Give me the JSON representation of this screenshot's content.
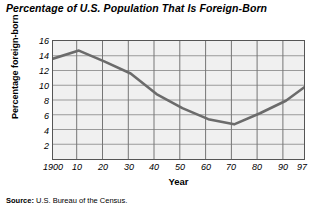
{
  "chart_data": {
    "type": "line",
    "title": "Percentage of U.S. Population That Is Foreign-Born",
    "xlabel": "Year",
    "ylabel": "Percentage foreign-born",
    "x": [
      1900,
      1910,
      1920,
      1930,
      1940,
      1950,
      1960,
      1970,
      1980,
      1990,
      1997
    ],
    "values": [
      13.6,
      14.7,
      13.2,
      11.6,
      8.8,
      6.9,
      5.4,
      4.7,
      6.2,
      7.9,
      9.7
    ],
    "x_tick_labels": [
      "1900",
      "10",
      "20",
      "30",
      "40",
      "50",
      "60",
      "70",
      "80",
      "90",
      "97"
    ],
    "y_tick_labels": [
      "2",
      "4",
      "6",
      "8",
      "10",
      "12",
      "14",
      "16"
    ],
    "y_ticks": [
      2,
      4,
      6,
      8,
      10,
      12,
      14,
      16
    ],
    "ylim": [
      0,
      16
    ],
    "xlim": [
      1900,
      1997
    ],
    "grid": true,
    "legend": "none",
    "line_color": "#6b6b6b",
    "plot_background": "#f0f0f0",
    "grid_color": "#9a9a9a",
    "axis_color": "#555555"
  },
  "source": {
    "label": "Source:",
    "text": "U.S. Bureau of the Census."
  }
}
